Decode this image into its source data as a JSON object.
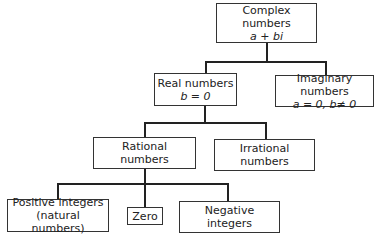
{
  "diagram": {
    "type": "tree",
    "nodes": {
      "complex": {
        "title": "Complex numbers",
        "sub": "a + bi"
      },
      "real": {
        "title": "Real numbers",
        "sub": "b = 0"
      },
      "imaginary": {
        "title": "Imaginary numbers",
        "sub": "a = 0, b≠ 0"
      },
      "rational": {
        "title": "Rational",
        "sub": "numbers"
      },
      "irrational": {
        "title": "Irrational",
        "sub": "numbers"
      },
      "positive": {
        "title": "Positive integers",
        "sub": "(natural numbers)"
      },
      "zero": {
        "title": "Zero"
      },
      "negative": {
        "title": "Negative",
        "sub": "integers"
      }
    },
    "edges": [
      [
        "complex",
        "real"
      ],
      [
        "complex",
        "imaginary"
      ],
      [
        "real",
        "rational"
      ],
      [
        "real",
        "irrational"
      ],
      [
        "rational",
        "positive"
      ],
      [
        "rational",
        "zero"
      ],
      [
        "rational",
        "negative"
      ]
    ]
  }
}
